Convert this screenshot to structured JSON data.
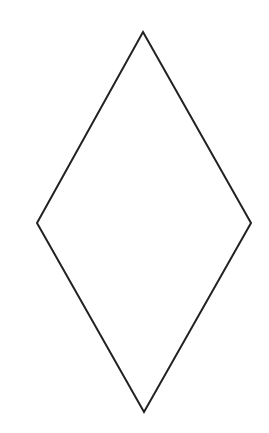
{
  "canvas": {
    "width": 269,
    "height": 433,
    "background": "#ffffff"
  },
  "shape": {
    "type": "rhombus",
    "stroke": "#222222",
    "stroke_width": 2,
    "fill": "none",
    "vertices": {
      "top": [
        143,
        32
      ],
      "right": [
        251,
        223
      ],
      "bottom": [
        144,
        412
      ],
      "left": [
        37,
        223
      ]
    }
  }
}
